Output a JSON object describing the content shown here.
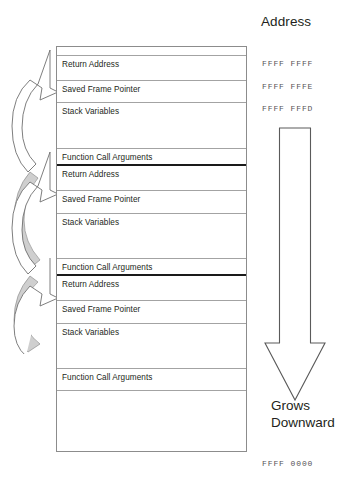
{
  "diagram": {
    "title_hidden": "",
    "stack": {
      "rows": [
        {
          "label": "",
          "top": 0,
          "height": 9,
          "kind": "spacer"
        },
        {
          "label": "Return Address",
          "top": 9,
          "height": 25,
          "kind": "normal"
        },
        {
          "label": "Saved Frame Pointer",
          "top": 34,
          "height": 22,
          "kind": "normal"
        },
        {
          "label": "Stack Variables",
          "top": 56,
          "height": 46,
          "kind": "normal"
        },
        {
          "label": "Function Call Arguments",
          "top": 102,
          "height": 17,
          "kind": "frame-end"
        },
        {
          "label": "Return Address",
          "top": 119,
          "height": 25,
          "kind": "normal"
        },
        {
          "label": "Saved Frame Pointer",
          "top": 144,
          "height": 23,
          "kind": "normal"
        },
        {
          "label": "Stack Variables",
          "top": 167,
          "height": 45,
          "kind": "normal"
        },
        {
          "label": "Function Call Arguments",
          "top": 212,
          "height": 17,
          "kind": "frame-end"
        },
        {
          "label": "Return Address",
          "top": 229,
          "height": 25,
          "kind": "normal"
        },
        {
          "label": "Saved Frame Pointer",
          "top": 254,
          "height": 23,
          "kind": "normal"
        },
        {
          "label": "Stack Variables",
          "top": 277,
          "height": 45,
          "kind": "normal"
        },
        {
          "label": "Function Call Arguments",
          "top": 322,
          "height": 22,
          "kind": "normal"
        },
        {
          "label": "",
          "top": 344,
          "height": 60,
          "kind": "last"
        }
      ]
    },
    "address_column": {
      "title": "Address",
      "top_address": "FFFF FFFF",
      "second_address": "FFFF FFFE",
      "third_address": "FFFF FFFD",
      "bottom_address": "FFFF 0000"
    },
    "grow_arrow": {
      "caption_line1": "Grows",
      "caption_line2": "Downward",
      "direction": "down"
    },
    "call_arrows": {
      "count": 3,
      "description": "curved-call-return-arrows"
    },
    "colors": {
      "ink": "#231f20",
      "rule": "#a3a3a3",
      "frame_rule": "#1a1a1a",
      "outline": "#8c8c8c",
      "arrow_shadow": "#c9c9c9",
      "address_text": "#555355"
    }
  }
}
